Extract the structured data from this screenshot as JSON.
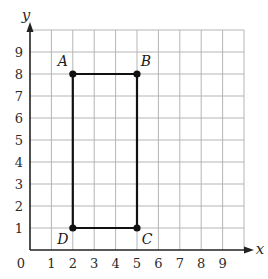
{
  "diagram": {
    "type": "coordinate-grid",
    "axes": {
      "x_label": "x",
      "y_label": "y",
      "origin_label": "0",
      "x_ticks": [
        "1",
        "2",
        "3",
        "4",
        "5",
        "6",
        "7",
        "8",
        "9"
      ],
      "y_ticks": [
        "1",
        "2",
        "3",
        "4",
        "5",
        "6",
        "7",
        "8",
        "9"
      ],
      "range": [
        0,
        10
      ]
    },
    "shape": "rectangle",
    "points": [
      {
        "label": "A",
        "x": 2,
        "y": 8
      },
      {
        "label": "B",
        "x": 5,
        "y": 8
      },
      {
        "label": "C",
        "x": 5,
        "y": 1
      },
      {
        "label": "D",
        "x": 2,
        "y": 1
      }
    ],
    "colors": {
      "grid": "#b5b5b5",
      "axis": "#222222",
      "shape": "#111111"
    }
  }
}
